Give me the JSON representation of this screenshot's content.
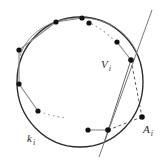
{
  "figure": {
    "kind": "geometry-diagram",
    "width": 166,
    "height": 166,
    "background_color": "#ffffff",
    "labels": {
      "circle": {
        "base": "k",
        "sub": "i",
        "text": "k i"
      },
      "vertex": {
        "base": "V",
        "sub": "i",
        "text": "V i"
      },
      "external_point": {
        "base": "A",
        "sub": "i",
        "text": "A i"
      }
    },
    "colors": {
      "stroke": "#2b2b2b",
      "chord_gray": "#8a8a8a",
      "dotted": "#9a9a9a",
      "dashed": "#4a4a4a",
      "point_fill": "#111111"
    },
    "circle": {
      "cx": 80,
      "cy": 82,
      "rx": 63,
      "ry": 65
    },
    "points": [
      {
        "name": "p1",
        "x": 56,
        "y": 22
      },
      {
        "name": "p2",
        "x": 82,
        "y": 18
      },
      {
        "name": "p3",
        "x": 89,
        "y": 23
      },
      {
        "name": "p4",
        "x": 117,
        "y": 42
      },
      {
        "name": "vertex-vi",
        "x": 131,
        "y": 60
      },
      {
        "name": "p6",
        "x": 19,
        "y": 50
      },
      {
        "name": "p7",
        "x": 19,
        "y": 84
      },
      {
        "name": "p8",
        "x": 38,
        "y": 111
      },
      {
        "name": "p9",
        "x": 88,
        "y": 130
      },
      {
        "name": "p10",
        "x": 108,
        "y": 130
      },
      {
        "name": "external-ai",
        "x": 142,
        "y": 117
      }
    ],
    "chords": [
      {
        "from": "p6",
        "to": "p1"
      },
      {
        "from": "p1",
        "to": "p2"
      },
      {
        "from": "p6",
        "to": "p7"
      },
      {
        "from": "p7",
        "to": "p8"
      },
      {
        "from": "p4",
        "to": "vertex-vi"
      },
      {
        "from": "p9",
        "to": "p10"
      }
    ],
    "dotted_arcs": [
      {
        "from": "p3",
        "to": "p4",
        "style": "dotted"
      },
      {
        "from": "p8",
        "to": "p9",
        "style": "dotted"
      }
    ],
    "solid_lines": [
      {
        "name": "secant-vi-to-bottom",
        "from": "vertex-vi",
        "to": "p10"
      }
    ],
    "dashed_lines": [
      {
        "name": "dashed-vi-to-ai",
        "from": "vertex-vi",
        "to": "external-ai"
      },
      {
        "name": "dashed-p10-to-ai",
        "from": "p10",
        "to": "external-ai"
      }
    ],
    "free_line": {
      "name": "line-l",
      "x1": 152,
      "y1": 10,
      "x2": 99,
      "y2": 157
    }
  }
}
